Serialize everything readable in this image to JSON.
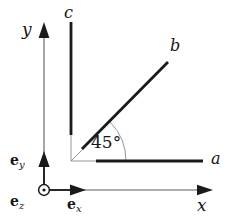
{
  "figure": {
    "type": "geometry-diagram",
    "background_color": "#ffffff",
    "ink_color": "#161616",
    "thin_line_color": "#6b6b6b"
  },
  "axes": {
    "y_label": "y",
    "x_label": "x",
    "y_axis": {
      "x": 44,
      "y_bottom": 190,
      "y_top": 24
    },
    "x_axis": {
      "y": 190,
      "x_left": 44,
      "x_right": 212
    }
  },
  "basis_vectors": [
    {
      "name": "e_x",
      "letter": "e",
      "subscript": "x",
      "direction": "+x",
      "tip": [
        85,
        190
      ]
    },
    {
      "name": "e_y",
      "letter": "e",
      "subscript": "y",
      "direction": "+y",
      "tip": [
        44,
        152
      ]
    },
    {
      "name": "e_z",
      "letter": "e",
      "subscript": "z",
      "direction": "out-of-page",
      "glyph": "circle-dot",
      "center": [
        44,
        190
      ]
    }
  ],
  "rays": [
    {
      "id": "a",
      "label": "a",
      "angle_deg": 0,
      "from": [
        71,
        161
      ],
      "to": [
        203,
        161
      ],
      "thick_from": [
        96,
        161
      ],
      "label_pos": [
        212,
        154
      ]
    },
    {
      "id": "b",
      "label": "b",
      "angle_deg": 45,
      "from": [
        71,
        161
      ],
      "to": [
        168,
        62
      ],
      "thick_from": [
        82,
        149
      ],
      "label_pos": [
        171,
        41
      ]
    },
    {
      "id": "c",
      "label": "c",
      "angle_deg": 90,
      "from": [
        71,
        161
      ],
      "to": [
        71,
        22
      ],
      "thick_from": [
        71,
        135
      ],
      "label_pos": [
        65,
        8
      ]
    }
  ],
  "angle_marker": {
    "label": "45°",
    "value": 45,
    "unit": "degrees",
    "vertex": [
      71,
      161
    ],
    "radius": 55,
    "from_ray": "a",
    "to_ray": "b",
    "label_pos": [
      92,
      134
    ]
  }
}
